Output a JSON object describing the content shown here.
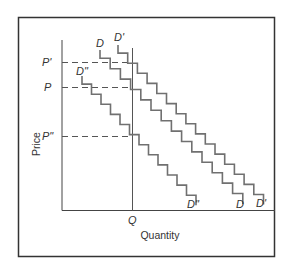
{
  "chart_data": {
    "type": "line",
    "title": "",
    "xlabel": "Quantity",
    "ylabel": "Price",
    "grid": false,
    "legend": "none (curves labeled inline at both ends)",
    "y_ticks": [
      {
        "label": "P'",
        "y": 62
      },
      {
        "label": "P",
        "y": 87
      },
      {
        "label": "P\"",
        "y": 136
      }
    ],
    "x_ticks": [
      {
        "label": "Q",
        "x": 132
      }
    ],
    "series": [
      {
        "name": "D\"",
        "start_label": "D\"",
        "end_label": "D\"",
        "start": [
          82,
          76
        ],
        "steps": 12,
        "step_w": 9.5,
        "step_h": 10.1,
        "end_x": 196,
        "end_y": 197
      },
      {
        "name": "D",
        "start_label": "D",
        "end_label": "D",
        "start": [
          100,
          50
        ],
        "steps": 14,
        "step_w": 10.2,
        "step_h": 10.4,
        "end_x": 243,
        "end_y": 196
      },
      {
        "name": "D'",
        "start_label": "D'",
        "end_label": "D'",
        "start": [
          118,
          45
        ],
        "steps": 15,
        "step_w": 9.7,
        "step_h": 10.1,
        "end_x": 264,
        "end_y": 197
      }
    ],
    "annotations": [
      "Dashed horizontal lines from P', P and P\" on the price axis to the intersections with D', D and D\" at quantity Q",
      "Vertical line at Q from the quantity axis up through all three curves"
    ]
  },
  "labels": {
    "y_axis_title": "Price",
    "x_axis_title": "Quantity",
    "p_prime": "P'",
    "p": "P",
    "p_double": "P\"",
    "q": "Q",
    "d_double_top": "D\"",
    "d_top": "D",
    "d_prime_top": "D'",
    "d_double_bottom": "D\"",
    "d_bottom": "D",
    "d_prime_bottom": "D'"
  },
  "colors": {
    "frame": "#333333",
    "axes": "#444444",
    "curves": "#707070",
    "dashes": "#555555",
    "text": "#333333"
  }
}
